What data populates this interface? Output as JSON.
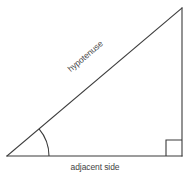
{
  "diagram": {
    "kind": "right-triangle",
    "background_color": "#ffffff",
    "stroke_color": "#3a3a3a",
    "text_color": "#444444",
    "canvas": {
      "width": 190,
      "height": 178
    },
    "vertices": {
      "left_angle_vertex": {
        "x": 7,
        "y": 156
      },
      "apex_vertex": {
        "x": 182,
        "y": 8
      },
      "right_angle_vertex": {
        "x": 182,
        "y": 156
      }
    },
    "sides": {
      "hypotenuse": {
        "label": "hypotenuse",
        "from": {
          "x": 7,
          "y": 156
        },
        "to": {
          "x": 182,
          "y": 8
        },
        "label_rotation_deg": -40.3
      },
      "adjacent": {
        "label": "adjacent side",
        "from": {
          "x": 7,
          "y": 156
        },
        "to": {
          "x": 182,
          "y": 156
        }
      },
      "opposite": {
        "label": "",
        "from": {
          "x": 182,
          "y": 8
        },
        "to": {
          "x": 182,
          "y": 156
        }
      }
    },
    "angle_arc": {
      "center": {
        "x": 7,
        "y": 156
      },
      "radius": 42,
      "start": {
        "x": 49,
        "y": 156
      },
      "end": {
        "x": 39,
        "y": 128.8
      }
    },
    "right_angle_marker": {
      "size": 16,
      "corner": {
        "x": 182,
        "y": 156
      }
    }
  }
}
